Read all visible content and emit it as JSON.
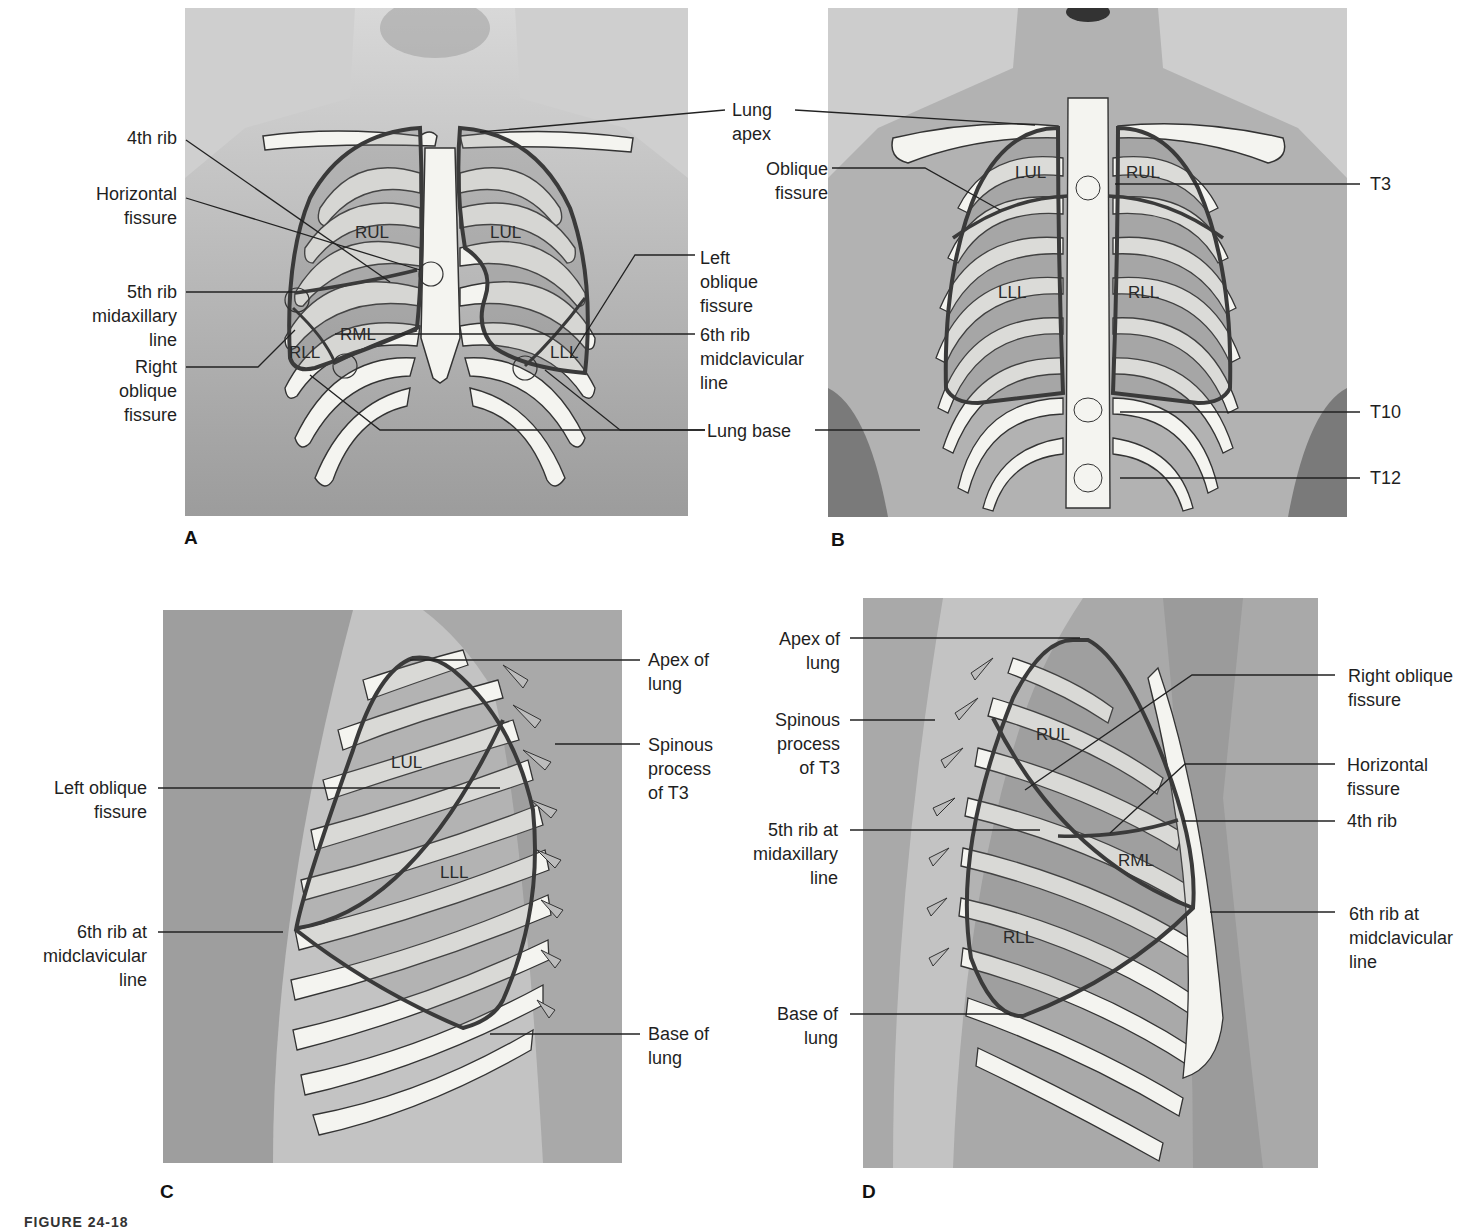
{
  "figure": {
    "caption_partial": "FIGURE 24-18",
    "panels": [
      {
        "id": "A",
        "view": "anterior",
        "letter": "A",
        "lobes": [
          "RUL",
          "LUL",
          "RML",
          "RLL",
          "LLL"
        ],
        "labels_left": [
          {
            "lines": [
              "4th rib"
            ]
          },
          {
            "lines": [
              "Horizontal",
              "fissure"
            ]
          },
          {
            "lines": [
              "5th rib",
              "midaxillary",
              "line"
            ]
          },
          {
            "lines": [
              "Right",
              "oblique",
              "fissure"
            ]
          }
        ],
        "labels_right": [
          {
            "lines": [
              "Lung",
              "apex"
            ]
          },
          {
            "lines": [
              "Left",
              "oblique",
              "fissure"
            ]
          },
          {
            "lines": [
              "6th rib",
              "midclavicular",
              "line"
            ]
          },
          {
            "lines": [
              "Lung base"
            ]
          }
        ]
      },
      {
        "id": "B",
        "view": "posterior",
        "letter": "B",
        "lobes": [
          "LUL",
          "RUL",
          "LLL",
          "RLL"
        ],
        "labels_left": [
          {
            "lines": [
              "Oblique",
              "fissure"
            ]
          }
        ],
        "labels_right": [
          {
            "lines": [
              "T3"
            ]
          },
          {
            "lines": [
              "T10"
            ]
          },
          {
            "lines": [
              "T12"
            ]
          }
        ]
      },
      {
        "id": "C",
        "view": "left lateral",
        "letter": "C",
        "lobes": [
          "LUL",
          "LLL"
        ],
        "labels_left": [
          {
            "lines": [
              "Left oblique",
              "fissure"
            ]
          },
          {
            "lines": [
              "6th rib at",
              "midclavicular",
              "line"
            ]
          }
        ],
        "labels_right": [
          {
            "lines": [
              "Apex of",
              "lung"
            ]
          },
          {
            "lines": [
              "Spinous",
              "process",
              "of T3"
            ]
          },
          {
            "lines": [
              "Base of",
              "lung"
            ]
          }
        ]
      },
      {
        "id": "D",
        "view": "right lateral",
        "letter": "D",
        "lobes": [
          "RUL",
          "RML",
          "RLL"
        ],
        "labels_left": [
          {
            "lines": [
              "Apex of",
              "lung"
            ]
          },
          {
            "lines": [
              "Spinous",
              "process",
              "of T3"
            ]
          },
          {
            "lines": [
              "5th rib at",
              "midaxillary",
              "line"
            ]
          },
          {
            "lines": [
              "Base of",
              "lung"
            ]
          }
        ],
        "labels_right": [
          {
            "lines": [
              "Right oblique",
              "fissure"
            ]
          },
          {
            "lines": [
              "Horizontal",
              "fissure"
            ]
          },
          {
            "lines": [
              "4th rib"
            ]
          },
          {
            "lines": [
              "6th rib at",
              "midclavicular",
              "line"
            ]
          }
        ]
      }
    ],
    "colors": {
      "background": "#ffffff",
      "skin_light": "#c9c9c9",
      "skin_dark": "#8f8f8f",
      "bone": "#f4f4f0",
      "lung_fill": "#9a9a9a",
      "outline": "#3a3a3a",
      "leader_line": "#222222"
    }
  }
}
